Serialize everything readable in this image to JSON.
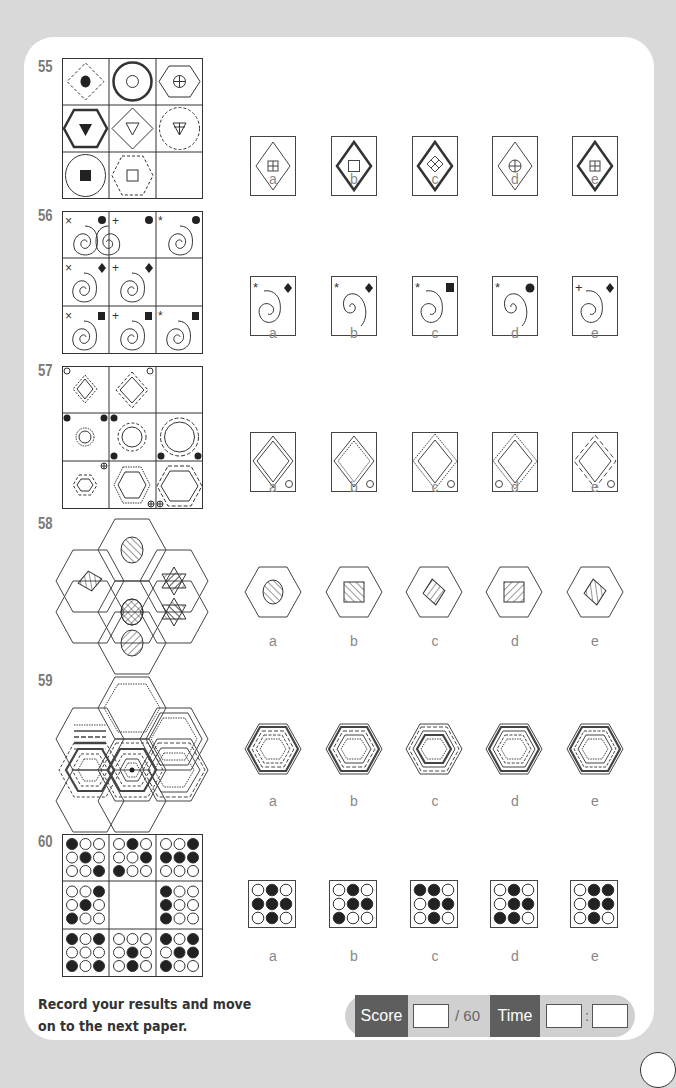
{
  "questions": [
    {
      "number": "55",
      "option_labels": [
        "a",
        "b",
        "c",
        "d",
        "e"
      ]
    },
    {
      "number": "56",
      "option_labels": [
        "a",
        "b",
        "c",
        "d",
        "e"
      ]
    },
    {
      "number": "57",
      "option_labels": [
        "a",
        "b",
        "c",
        "d",
        "e"
      ]
    },
    {
      "number": "58",
      "option_labels": [
        "a",
        "b",
        "c",
        "d",
        "e"
      ]
    },
    {
      "number": "59",
      "option_labels": [
        "a",
        "b",
        "c",
        "d",
        "e"
      ]
    },
    {
      "number": "60",
      "option_labels": [
        "a",
        "b",
        "c",
        "d",
        "e"
      ]
    }
  ],
  "q60": {
    "grid": [
      [
        [
          1,
          0,
          0,
          0,
          1,
          0,
          0,
          0,
          1
        ],
        [
          0,
          1,
          0,
          0,
          0,
          1,
          1,
          0,
          0
        ],
        [
          0,
          0,
          1,
          1,
          1,
          1,
          0,
          0,
          0
        ]
      ],
      [
        [
          0,
          0,
          1,
          0,
          1,
          0,
          1,
          0,
          0
        ],
        null,
        [
          1,
          0,
          0,
          1,
          0,
          0,
          1,
          0,
          0
        ]
      ],
      [
        [
          1,
          0,
          1,
          0,
          0,
          0,
          1,
          0,
          1
        ],
        [
          0,
          0,
          0,
          0,
          1,
          0,
          0,
          1,
          0
        ],
        [
          1,
          0,
          1,
          0,
          1,
          1,
          1,
          0,
          0
        ]
      ]
    ],
    "options": [
      [
        0,
        1,
        0,
        1,
        1,
        1,
        0,
        1,
        0
      ],
      [
        0,
        1,
        0,
        0,
        1,
        1,
        1,
        0,
        0
      ],
      [
        1,
        1,
        0,
        0,
        1,
        1,
        0,
        1,
        0
      ],
      [
        0,
        1,
        0,
        0,
        1,
        1,
        1,
        1,
        0
      ],
      [
        0,
        1,
        1,
        0,
        1,
        1,
        0,
        1,
        0
      ]
    ]
  },
  "footer": {
    "instruction_line1": "Record your results and move",
    "instruction_line2": "on to the next paper.",
    "score_label": "Score",
    "score_total": "/ 60",
    "time_label": "Time",
    "time_separator": ":",
    "score_value": "",
    "time_minutes": "",
    "time_seconds": ""
  },
  "colors": {
    "background": "#d9d9d9",
    "card": "#ffffff",
    "label_dark": "#5e5e5e",
    "scorebar_bg": "#d0d0d0",
    "question_number": "#7a7a7a"
  }
}
